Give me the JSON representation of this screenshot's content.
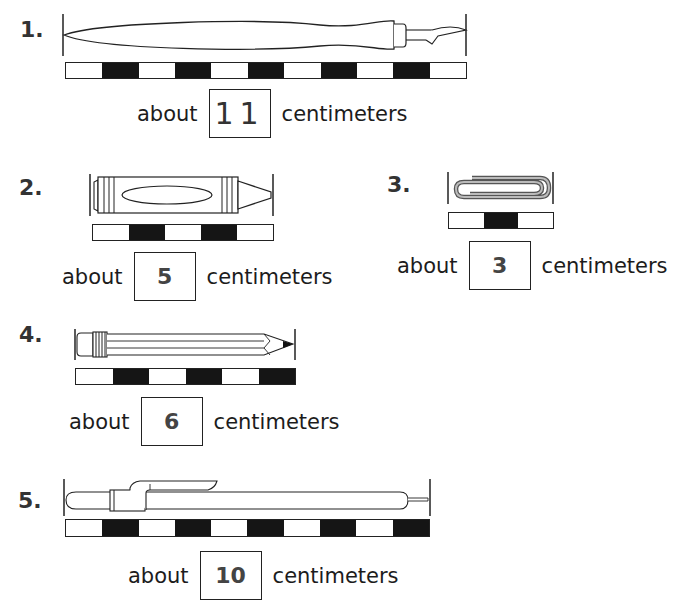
{
  "page": {
    "header_partial": "Estimate the length of each object in centimeters."
  },
  "items": [
    {
      "number": "1.",
      "object": "fountain pen",
      "ruler_segments": 11,
      "prefix": "about",
      "answer": "11",
      "unit": "centimeters"
    },
    {
      "number": "2.",
      "object": "crayon",
      "ruler_segments": 5,
      "prefix": "about",
      "answer": "5",
      "unit": "centimeters"
    },
    {
      "number": "3.",
      "object": "paper clip",
      "ruler_segments": 3,
      "prefix": "about",
      "answer": "3",
      "unit": "centimeters"
    },
    {
      "number": "4.",
      "object": "pencil",
      "ruler_segments": 6,
      "prefix": "about",
      "answer": "6",
      "unit": "centimeters"
    },
    {
      "number": "5.",
      "object": "mechanical pencil",
      "ruler_segments": 10,
      "prefix": "about",
      "answer": "10",
      "unit": "centimeters"
    }
  ]
}
